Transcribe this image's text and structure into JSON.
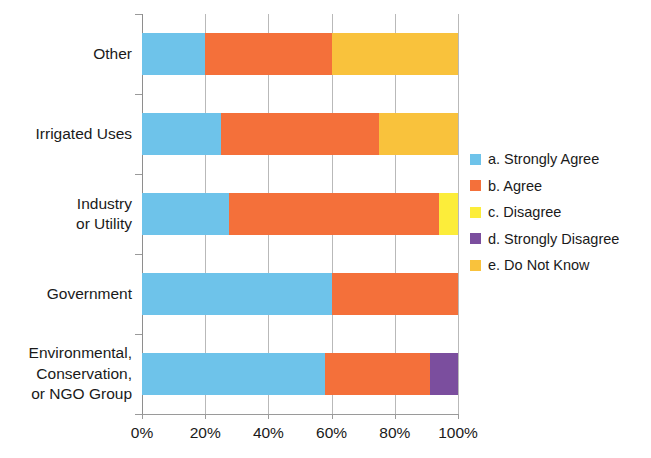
{
  "chart_data": {
    "type": "bar",
    "subtype": "horizontal-stacked-100",
    "title": "",
    "xlabel": "",
    "ylabel": "",
    "xlim": [
      0,
      100
    ],
    "xticks": [
      "0%",
      "20%",
      "40%",
      "60%",
      "80%",
      "100%"
    ],
    "xtick_values": [
      0,
      20,
      40,
      60,
      80,
      100
    ],
    "grid": true,
    "legend_position": "right",
    "categories": [
      "Other",
      "Irrigated Uses",
      "Industry\nor Utility",
      "Government",
      "Environmental,\nConservation,\nor NGO Group"
    ],
    "series": [
      {
        "name": "a. Strongly Agree",
        "color": "#6ec3ea",
        "values": [
          20,
          25,
          27.5,
          60,
          58
        ]
      },
      {
        "name": "b. Agree",
        "color": "#f4703a",
        "values": [
          40,
          50,
          66.5,
          40,
          33
        ]
      },
      {
        "name": "c. Disagree",
        "color": "#fced3a",
        "values": [
          0,
          0,
          6,
          0,
          0
        ]
      },
      {
        "name": "d. Strongly Disagree",
        "color": "#7b4e9e",
        "values": [
          0,
          0,
          0,
          0,
          9
        ]
      },
      {
        "name": "e. Do Not Know",
        "color": "#f9c23c",
        "values": [
          40,
          25,
          0,
          0,
          0
        ]
      }
    ]
  },
  "legend": {
    "items": [
      {
        "label": "a. Strongly Agree",
        "color": "#6ec3ea"
      },
      {
        "label": "b. Agree",
        "color": "#f4703a"
      },
      {
        "label": "c. Disagree",
        "color": "#fced3a"
      },
      {
        "label": "d. Strongly Disagree",
        "color": "#7b4e9e"
      },
      {
        "label": "e. Do Not Know",
        "color": "#f9c23c"
      }
    ]
  },
  "axis": {
    "x_tick_labels": [
      "0%",
      "20%",
      "40%",
      "60%",
      "80%",
      "100%"
    ],
    "y_category_labels": [
      "Other",
      "Irrigated Uses",
      "Industry\nor Utility",
      "Government",
      "Environmental,\nConservation,\nor NGO Group"
    ]
  }
}
